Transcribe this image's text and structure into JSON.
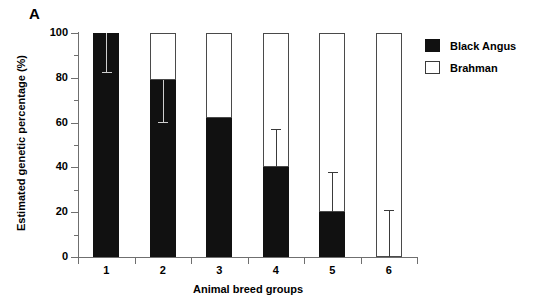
{
  "panel": {
    "label": "A"
  },
  "chart_data": {
    "type": "bar",
    "subtype": "stacked-bar-with-error-bars",
    "title": "",
    "xlabel": "Animal breed groups",
    "ylabel": "Estimated genetic percentage (%)",
    "categories": [
      "1",
      "2",
      "3",
      "4",
      "5",
      "6"
    ],
    "ylim": [
      0,
      100
    ],
    "yticks": [
      0,
      20,
      40,
      60,
      80,
      100
    ],
    "yticklabels": [
      "0",
      "20",
      "40",
      "60",
      "80",
      "100"
    ],
    "yminorticks": [
      10,
      30,
      50,
      70,
      90
    ],
    "grid": false,
    "legend_position": "upper right",
    "series": [
      {
        "name": "Black Angus",
        "color": "#111111",
        "values": [
          100,
          79,
          62,
          40,
          20,
          0
        ]
      },
      {
        "name": "Brahman",
        "color": "#ffffff",
        "values": [
          0,
          21,
          38,
          60,
          80,
          100
        ]
      }
    ],
    "error_bars": [
      {
        "category": "1",
        "value": 100,
        "low": 82,
        "high": 100,
        "direction": "down",
        "drawn_color": "light"
      },
      {
        "category": "2",
        "value": 79,
        "low": 60,
        "high": 79,
        "direction": "down",
        "drawn_color": "light"
      },
      {
        "category": "3",
        "value": 62,
        "low": 62,
        "high": 62,
        "direction": "none",
        "drawn_color": "none"
      },
      {
        "category": "4",
        "value": 40,
        "low": 40,
        "high": 57,
        "direction": "up",
        "drawn_color": "dark"
      },
      {
        "category": "5",
        "value": 20,
        "low": 20,
        "high": 38,
        "direction": "up",
        "drawn_color": "dark"
      },
      {
        "category": "6",
        "value": 0,
        "low": 0,
        "high": 21,
        "direction": "up",
        "drawn_color": "dark"
      }
    ]
  },
  "legend": {
    "items": [
      {
        "label": "Black Angus",
        "style": "filled"
      },
      {
        "label": "Brahman",
        "style": "open"
      }
    ]
  }
}
